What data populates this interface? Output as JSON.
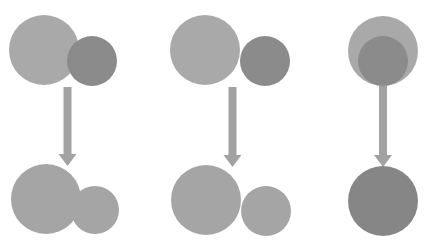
{
  "diagram": {
    "colors": {
      "background": "#ffffff",
      "light_circle": "#a9a9a9",
      "dark_circle": "#8b8b8b",
      "result_circle": "#a5a5a5",
      "merged_result": "#868686",
      "arrow": "#a2a2a2"
    },
    "columns": [
      {
        "id": "left",
        "top": [
          {
            "cx": 44,
            "cy": 50,
            "r": 35,
            "fill": "light_circle"
          },
          {
            "cx": 92,
            "cy": 61,
            "r": 25,
            "fill": "dark_circle"
          }
        ],
        "arrow": {
          "x": 67.5,
          "y1": 87,
          "y2": 166
        },
        "bottom": [
          {
            "cx": 46,
            "cy": 199,
            "r": 35,
            "fill": "result_circle"
          },
          {
            "cx": 95,
            "cy": 210,
            "r": 24,
            "fill": "result_circle"
          }
        ]
      },
      {
        "id": "middle",
        "top": [
          {
            "cx": 205,
            "cy": 50,
            "r": 35,
            "fill": "light_circle"
          },
          {
            "cx": 265,
            "cy": 61,
            "r": 25,
            "fill": "dark_circle"
          }
        ],
        "arrow": {
          "x": 232.5,
          "y1": 87,
          "y2": 167
        },
        "bottom": [
          {
            "cx": 206,
            "cy": 200,
            "r": 35,
            "fill": "result_circle"
          },
          {
            "cx": 266,
            "cy": 211,
            "r": 25,
            "fill": "result_circle"
          }
        ]
      },
      {
        "id": "right",
        "top": [
          {
            "cx": 383,
            "cy": 51,
            "r": 35,
            "fill": "light_circle"
          },
          {
            "cx": 383,
            "cy": 61,
            "r": 25,
            "fill": "dark_circle"
          }
        ],
        "arrow": {
          "x": 383,
          "y1": 86,
          "y2": 167
        },
        "bottom": [
          {
            "cx": 383,
            "cy": 201,
            "r": 35,
            "fill": "merged_result"
          }
        ]
      }
    ]
  }
}
